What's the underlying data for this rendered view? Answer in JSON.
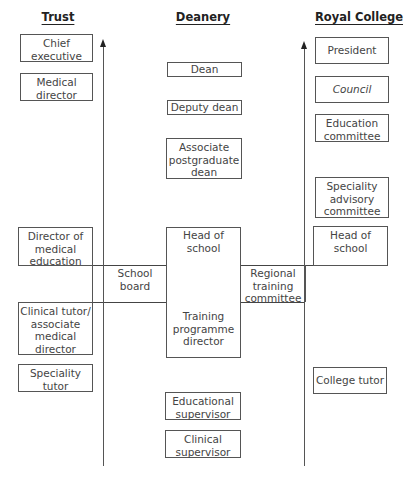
{
  "columns": {
    "trust": {
      "heading": "Trust",
      "boxes": [
        {
          "id": "chief-executive",
          "label": "Chief\nexecutive"
        },
        {
          "id": "medical-director",
          "label": "Medical\ndirector"
        },
        {
          "id": "director-of-medical-education",
          "label": "Director of\nmedical\neducation"
        },
        {
          "id": "clinical-tutor",
          "label": "Clinical tutor/\nassociate\nmedical\ndirector"
        },
        {
          "id": "speciality-tutor",
          "label": "Speciality\ntutor"
        }
      ]
    },
    "deanery": {
      "heading": "Deanery",
      "boxes": [
        {
          "id": "dean",
          "label": "Dean"
        },
        {
          "id": "deputy-dean",
          "label": "Deputy dean"
        },
        {
          "id": "associate-postgraduate-dean",
          "label": "Associate\npostgraduate\ndean"
        },
        {
          "id": "head-of-school",
          "label": "Head of\nschool"
        },
        {
          "id": "training-programme-director",
          "label": "Training\nprogramme\ndirector"
        },
        {
          "id": "educational-supervisor",
          "label": "Educational\nsupervisor"
        },
        {
          "id": "clinical-supervisor",
          "label": "Clinical\nsupervisor"
        }
      ]
    },
    "royal_college": {
      "heading": "Royal College",
      "boxes": [
        {
          "id": "president",
          "label": "President"
        },
        {
          "id": "council",
          "label": "Council",
          "italic": true
        },
        {
          "id": "education-committee",
          "label": "Education\ncommittee"
        },
        {
          "id": "speciality-advisory-committee",
          "label": "Speciality\nadvisory\ncommittee"
        },
        {
          "id": "head-of-school-college",
          "label": "Head of\nschool"
        },
        {
          "id": "college-tutor",
          "label": "College tutor"
        }
      ]
    }
  },
  "connectors": {
    "school_board": "School board",
    "regional_training_committee": "Regional\ntraining\ncommittee"
  },
  "arrows": [
    {
      "id": "trust-deanery-arrow",
      "direction": "up"
    },
    {
      "id": "deanery-college-arrow",
      "direction": "up"
    }
  ]
}
